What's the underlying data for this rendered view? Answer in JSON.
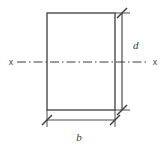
{
  "figure": {
    "kind": "engineering-cross-section",
    "background_color": "#ffffff",
    "stroke_color": "#4a4a4a",
    "centerline_color": "#3c3c3c",
    "section": {
      "shape": "rectangle",
      "left": 47,
      "top": 13,
      "right": 115,
      "bottom": 110,
      "width_px": 68,
      "height_px": 97,
      "fill": "none",
      "stroke_width": 1.4
    },
    "axis": {
      "name": "neutral-axis",
      "y": 62,
      "x_start": 17,
      "x_end": 149,
      "pattern": "dash-dot",
      "left_label": "x",
      "right_label": "x",
      "left_label_x": 11,
      "right_label_x": 155
    },
    "dimensions": [
      {
        "name": "depth",
        "label": "d",
        "orientation": "vertical",
        "line_x": 122,
        "from": 13,
        "to": 110,
        "label_x": 133,
        "label_y": 45,
        "tick_style": "slash",
        "extension_from": 115,
        "extension_to": 130
      },
      {
        "name": "width",
        "label": "b",
        "orientation": "horizontal",
        "line_y": 120,
        "from": 47,
        "to": 115,
        "label_x": 79,
        "label_y": 140,
        "tick_style": "slash",
        "extension_from": 110,
        "extension_to": 127
      }
    ]
  }
}
